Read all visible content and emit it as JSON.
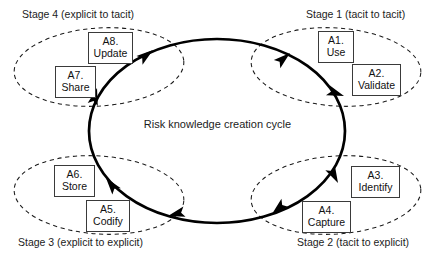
{
  "diagram": {
    "center_label": "Risk knowledge creation cycle",
    "flow_direction": "clockwise",
    "stages": [
      {
        "id": "stage-1",
        "caption": "Stage 1 (tacit to tacit)",
        "quadrant": "top-right",
        "nodes": [
          "A1. Use",
          "A2. Validate"
        ]
      },
      {
        "id": "stage-2",
        "caption": "Stage 2 (tacit to explicit)",
        "quadrant": "bottom-right",
        "nodes": [
          "A3. Identify",
          "A4. Capture"
        ]
      },
      {
        "id": "stage-3",
        "caption": "Stage 3 (explicit to explicit)",
        "quadrant": "bottom-left",
        "nodes": [
          "A5. Codify",
          "A6. Store"
        ]
      },
      {
        "id": "stage-4",
        "caption": "Stage 4 (explicit to tacit)",
        "quadrant": "top-left",
        "nodes": [
          "A7. Share",
          "A8. Update"
        ]
      }
    ],
    "nodes": [
      {
        "id": "a1",
        "code": "A1.",
        "label": "Use",
        "stage": "stage-1"
      },
      {
        "id": "a2",
        "code": "A2.",
        "label": "Validate",
        "stage": "stage-1"
      },
      {
        "id": "a3",
        "code": "A3.",
        "label": "Identify",
        "stage": "stage-2"
      },
      {
        "id": "a4",
        "code": "A4.",
        "label": "Capture",
        "stage": "stage-2"
      },
      {
        "id": "a5",
        "code": "A5.",
        "label": "Codify",
        "stage": "stage-3"
      },
      {
        "id": "a6",
        "code": "A6.",
        "label": "Store",
        "stage": "stage-3"
      },
      {
        "id": "a7",
        "code": "A7.",
        "label": "Share",
        "stage": "stage-4"
      },
      {
        "id": "a8",
        "code": "A8.",
        "label": "Update",
        "stage": "stage-4"
      }
    ],
    "colors": {
      "background": "#ffffff",
      "cycle_stroke": "#000000",
      "stage_stroke": "#1a1a1a",
      "box_border": "#3a3a3a",
      "text": "#1c1c1c"
    }
  }
}
